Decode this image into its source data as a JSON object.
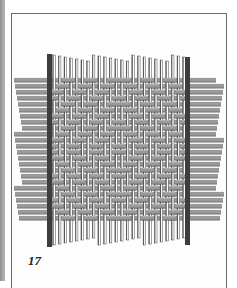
{
  "figure": {
    "number": "17"
  },
  "weave": {
    "colors": {
      "strand_fill": "#9a9a9a",
      "strand_dark": "#4a4a4a",
      "strand_light": "#c4c4c4",
      "post": "#3d3d3d",
      "gap": "#ffffff"
    },
    "vertical": {
      "x_start": 54,
      "x_end": 184,
      "count": 24,
      "y_top": 55,
      "y_bottom": 245
    },
    "horizontal": {
      "x_left": 18,
      "x_right": 220,
      "y_start": 80,
      "y_end": 218,
      "count": 24
    },
    "posts": [
      {
        "x": 47,
        "y_top": 54,
        "y_bottom": 247,
        "w": 5
      },
      {
        "x": 185,
        "y_top": 57,
        "y_bottom": 245,
        "w": 5
      }
    ]
  }
}
